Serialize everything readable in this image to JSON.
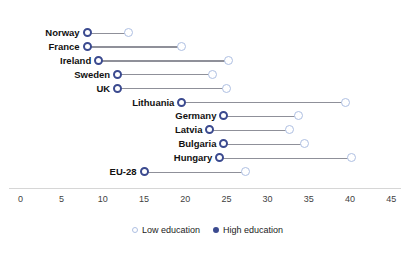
{
  "chart_data": {
    "type": "dumbbell",
    "title": "",
    "subtitle": "",
    "xlabel": "",
    "ylabel": "",
    "xlim": [
      0,
      45
    ],
    "xticks": [
      0,
      5,
      10,
      15,
      20,
      25,
      30,
      35,
      40,
      45
    ],
    "grid": false,
    "legend_position": "bottom-center",
    "categories": [
      "Norway",
      "France",
      "Ireland",
      "Sweden",
      "UK",
      "Lithuania",
      "Germany",
      "Latvia",
      "Bulgaria",
      "Hungary",
      "EU-28"
    ],
    "series": [
      {
        "name": "Low education",
        "color": "#aebfe2",
        "values": [
          13.1,
          19.5,
          25.2,
          23.3,
          25.0,
          39.4,
          33.7,
          32.7,
          34.5,
          40.2,
          27.3
        ]
      },
      {
        "name": "High education",
        "color": "#3b4a8f",
        "values": [
          8.1,
          8.1,
          9.5,
          11.8,
          11.8,
          19.6,
          24.7,
          23.0,
          24.7,
          24.2,
          15.0
        ]
      }
    ],
    "connector_color": "#8f9099",
    "axis_line_color": "#d6d6d6"
  },
  "legend": {
    "items": [
      {
        "label": "Low education",
        "marker": "open-circle-light"
      },
      {
        "label": "High education",
        "marker": "filled-circle-dark"
      }
    ]
  },
  "axis": {
    "tick_labels": [
      "0",
      "5",
      "10",
      "15",
      "20",
      "25",
      "30",
      "35",
      "40",
      "45"
    ]
  }
}
